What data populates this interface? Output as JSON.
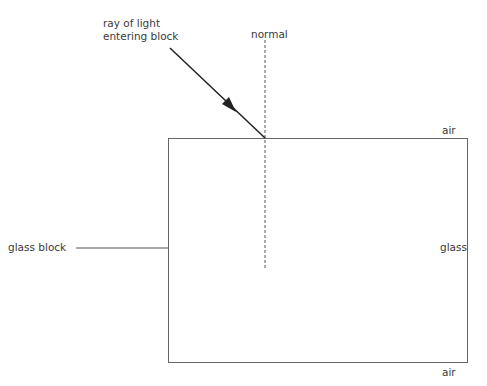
{
  "labels": {
    "ray_line1": "ray of light",
    "ray_line2": "entering block",
    "normal": "normal",
    "air_top": "air",
    "air_bottom": "air",
    "glass": "glass",
    "glass_block": "glass block"
  },
  "colors": {
    "stroke": "#555555",
    "ray": "#222222",
    "text": "#3a3a3a"
  }
}
